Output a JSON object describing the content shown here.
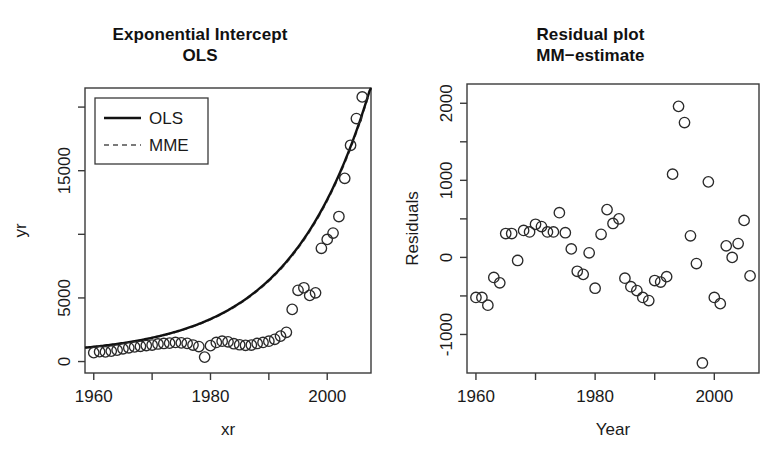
{
  "figure": {
    "width": 781,
    "height": 465,
    "background": "#ffffff",
    "ink": "#1a1a1a"
  },
  "panels": {
    "left": {
      "title_line1": "Exponential Intercept",
      "title_line2": "OLS",
      "xlabel": "xr",
      "ylabel": "yr",
      "legend": {
        "items": [
          {
            "label": "OLS",
            "style": "solid"
          },
          {
            "label": "MME",
            "style": "dashed"
          }
        ]
      }
    },
    "right": {
      "title_line1": "Residual plot",
      "title_line2": "MM−estimate",
      "xlabel": "Year",
      "ylabel": "Residuals"
    }
  },
  "chart_data": [
    {
      "type": "scatter",
      "id": "exponential-intercept-ols",
      "title": "Exponential Intercept OLS",
      "xlabel": "xr",
      "ylabel": "yr",
      "xlim": [
        1958.5,
        2007.5
      ],
      "ylim": [
        -900,
        21500
      ],
      "xticks": [
        1960,
        1970,
        1980,
        1990,
        2000
      ],
      "xticklabels": [
        "1960",
        "",
        "1980",
        "",
        "2000"
      ],
      "yticks": [
        0,
        5000,
        10000,
        15000,
        20000
      ],
      "yticklabels": [
        "0",
        "5000",
        "",
        "15000",
        ""
      ],
      "grid": false,
      "legend": [
        "OLS",
        "MME"
      ],
      "legend_position": "top-left",
      "x": [
        1960,
        1961,
        1962,
        1963,
        1964,
        1965,
        1966,
        1967,
        1968,
        1969,
        1970,
        1971,
        1972,
        1973,
        1974,
        1975,
        1976,
        1977,
        1978,
        1979,
        1980,
        1981,
        1982,
        1983,
        1984,
        1985,
        1986,
        1987,
        1988,
        1989,
        1990,
        1991,
        1992,
        1993,
        1994,
        1995,
        1996,
        1997,
        1998,
        1999,
        2000,
        2001,
        2002,
        2003,
        2004,
        2005,
        2006
      ],
      "y": [
        700,
        780,
        760,
        820,
        900,
        1000,
        1080,
        1150,
        1200,
        1260,
        1300,
        1380,
        1420,
        1450,
        1500,
        1470,
        1430,
        1300,
        1180,
        350,
        1250,
        1500,
        1600,
        1550,
        1400,
        1320,
        1280,
        1300,
        1420,
        1500,
        1600,
        1750,
        2000,
        2300,
        4100,
        5600,
        5800,
        5200,
        5400,
        8900,
        9600,
        10100,
        11400,
        14400,
        17000,
        19100,
        20800
      ],
      "series": [
        {
          "name": "OLS",
          "style": "solid",
          "model": "exponential",
          "note": "fitted exponential curve through observations"
        },
        {
          "name": "MME",
          "style": "dashed",
          "model": "exponential",
          "note": "MM-estimate fit, nearly coincident with OLS"
        }
      ]
    },
    {
      "type": "scatter",
      "id": "residual-plot-mm-estimate",
      "title": "Residual plot MM-estimate",
      "xlabel": "Year",
      "ylabel": "Residuals",
      "xlim": [
        1958.5,
        2007.5
      ],
      "ylim": [
        -1500,
        2250
      ],
      "xticks": [
        1960,
        1970,
        1980,
        1990,
        2000
      ],
      "xticklabels": [
        "1960",
        "",
        "1980",
        "",
        "2000"
      ],
      "yticks": [
        -1000,
        -500,
        0,
        500,
        1000,
        1500,
        2000
      ],
      "yticklabels": [
        "-1000",
        "",
        "0",
        "",
        "1000",
        "",
        "2000"
      ],
      "grid": false,
      "x": [
        1960,
        1961,
        1962,
        1963,
        1964,
        1965,
        1966,
        1967,
        1968,
        1969,
        1970,
        1971,
        1972,
        1973,
        1974,
        1975,
        1976,
        1977,
        1978,
        1979,
        1980,
        1981,
        1982,
        1983,
        1984,
        1985,
        1986,
        1987,
        1988,
        1989,
        1990,
        1991,
        1992,
        1993,
        1994,
        1995,
        1996,
        1997,
        1998,
        1999,
        2000,
        2001,
        2002,
        2003,
        2004,
        2005,
        2006
      ],
      "y": [
        -520,
        -520,
        -620,
        -260,
        -330,
        310,
        310,
        -40,
        350,
        330,
        430,
        400,
        330,
        330,
        580,
        320,
        110,
        -180,
        -220,
        60,
        -400,
        300,
        620,
        440,
        500,
        -270,
        -380,
        -430,
        -520,
        -560,
        -300,
        -320,
        -250,
        1080,
        1960,
        1750,
        280,
        -80,
        -1370,
        980,
        -520,
        -600,
        150,
        0,
        180,
        480,
        -240
      ]
    }
  ]
}
